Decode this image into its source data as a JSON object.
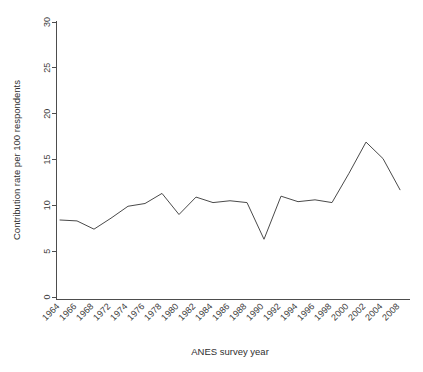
{
  "chart_data": {
    "type": "line",
    "title": "",
    "xlabel": "ANES survey year",
    "ylabel": "Contribution rate per 100 respondents",
    "categories": [
      "1964",
      "1966",
      "1968",
      "1972",
      "1974",
      "1976",
      "1978",
      "1980",
      "1982",
      "1984",
      "1986",
      "1988",
      "1990",
      "1992",
      "1994",
      "1996",
      "1998",
      "2000",
      "2002",
      "2004",
      "2008"
    ],
    "values": [
      8.4,
      8.3,
      7.4,
      8.6,
      9.9,
      10.2,
      11.3,
      9.0,
      10.9,
      10.3,
      10.5,
      10.3,
      6.3,
      11.0,
      10.4,
      10.6,
      10.3,
      13.5,
      16.9,
      15.1,
      11.7
    ],
    "series": [
      {
        "name": "Contribution rate",
        "values": [
          8.4,
          8.3,
          7.4,
          8.6,
          9.9,
          10.2,
          11.3,
          9.0,
          10.9,
          10.3,
          10.5,
          10.3,
          6.3,
          11.0,
          10.4,
          10.6,
          10.3,
          13.5,
          16.9,
          15.1,
          11.7
        ]
      }
    ],
    "ylim": [
      0,
      30
    ],
    "yticks": [
      0,
      5,
      10,
      15,
      20,
      25,
      30
    ],
    "ytick_labels": [
      "0",
      "5",
      "10",
      "15",
      "20",
      "25",
      "30"
    ],
    "grid": false,
    "legend": false,
    "line_color": "#4a4a4a",
    "xtick_rotation": 45
  }
}
